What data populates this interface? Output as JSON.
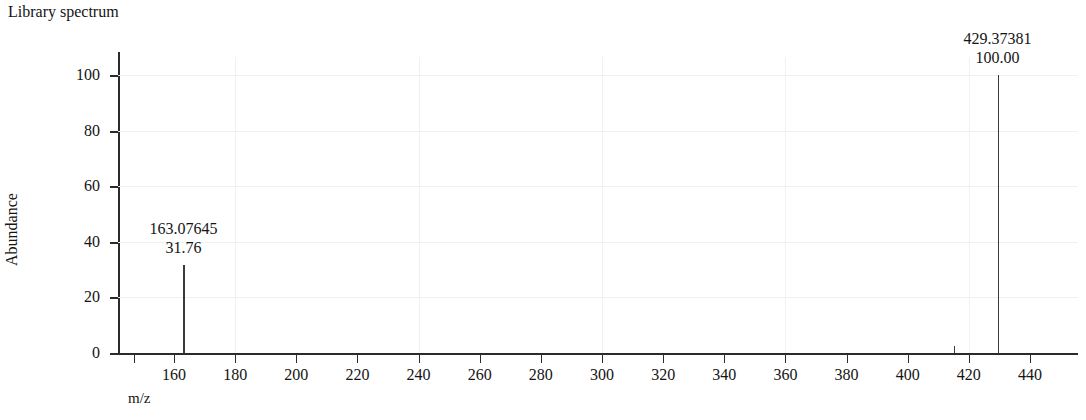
{
  "chart_data": {
    "type": "bar",
    "title": "Library spectrum",
    "xlabel": "m/z",
    "ylabel": "Abundance",
    "xlim": [
      143,
      457
    ],
    "ylim": [
      0,
      105
    ],
    "grid": true,
    "legend": "none",
    "xticks": [
      160,
      180,
      200,
      220,
      240,
      260,
      280,
      300,
      320,
      340,
      360,
      380,
      400,
      420,
      440
    ],
    "xtick_labels": [
      "160",
      "180",
      "200",
      "220",
      "240",
      "260",
      "280",
      "300",
      "320",
      "340",
      "360",
      "380",
      "400",
      "420",
      "440"
    ],
    "yticks": [
      0,
      20,
      40,
      60,
      80,
      100
    ],
    "ytick_labels": [
      "0",
      "20",
      "40",
      "60",
      "80",
      "100"
    ],
    "x": [
      163.07645,
      415.0,
      429.37381
    ],
    "values": [
      31.76,
      2.6,
      100.0
    ],
    "peaks": [
      {
        "mz": 163.07645,
        "abundance": 31.76,
        "mz_label": "163.07645",
        "abundance_label": "31.76",
        "labeled": true
      },
      {
        "mz": 415.0,
        "abundance": 2.6,
        "mz_label": "",
        "abundance_label": "",
        "labeled": false
      },
      {
        "mz": 429.37381,
        "abundance": 100.0,
        "mz_label": "429.37381",
        "abundance_label": "100.00",
        "labeled": true
      }
    ]
  },
  "colors": {
    "peak": "#3a3a3a",
    "axis": "#2b2b2b",
    "grid": "#f0f0f1",
    "text": "#141414",
    "background": "#ffffff"
  }
}
